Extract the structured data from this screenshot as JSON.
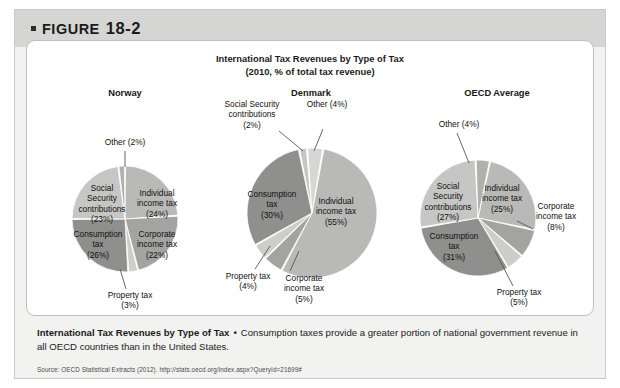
{
  "figure": {
    "label_prefix": "FIGURE",
    "number": "18-2"
  },
  "chart": {
    "title": "International Tax Revenues by Type of Tax",
    "subtitle": "(2010, % of total tax revenue)"
  },
  "caption": {
    "title": "International Tax Revenues by Type of Tax",
    "separator": "•",
    "body": "Consumption taxes provide a greater portion of national government revenue in all OECD countries than in the United States."
  },
  "source": {
    "text": "Source: OECD Statistical Extracts (2012). http://stats.oecd.org/index.aspx?QueryId=21699#"
  },
  "chart_data": [
    {
      "type": "pie",
      "title": "Norway",
      "categories": [
        "Individual income tax",
        "Corporate income tax",
        "Property tax",
        "Consumption tax",
        "Social Security contributions",
        "Other"
      ],
      "values": [
        24,
        22,
        3,
        26,
        23,
        2
      ],
      "labels": [
        "Individual\nincome tax\n(24%)",
        "Corporate\nincome tax\n(22%)",
        "Property tax\n(3%)",
        "Consumption\ntax\n(26%)",
        "Social\nSecurity\ncontributions\n(23%)",
        "Other (2%)"
      ],
      "colors": [
        "#b9b9b7",
        "#a3a3a1",
        "#cdcdcb",
        "#8f8f8d",
        "#c6c6c4",
        "#b0b0ae"
      ]
    },
    {
      "type": "pie",
      "title": "Denmark",
      "categories": [
        "Individual income tax",
        "Corporate income tax",
        "Property tax",
        "Consumption tax",
        "Social Security contributions",
        "Other"
      ],
      "values": [
        55,
        5,
        4,
        30,
        2,
        4
      ],
      "labels": [
        "Individual\nincome tax\n(55%)",
        "Corporate\nincome tax\n(5%)",
        "Property tax\n(4%)",
        "Consumption\ntax\n(30%)",
        "Social Security\ncontributions\n(2%)",
        "Other (4%)"
      ],
      "colors": [
        "#b9b9b7",
        "#a3a3a1",
        "#cdcdcb",
        "#8f8f8d",
        "#c6c6c4",
        "#d6d6d4"
      ]
    },
    {
      "type": "pie",
      "title": "OECD Average",
      "categories": [
        "Individual income tax",
        "Corporate income tax",
        "Property tax",
        "Consumption tax",
        "Social Security contributions",
        "Other"
      ],
      "values": [
        25,
        8,
        5,
        31,
        27,
        4
      ],
      "labels": [
        "Individual\nincome tax\n(25%)",
        "Corporate\nincome tax\n(8%)",
        "Property tax\n(5%)",
        "Consumption\ntax\n(31%)",
        "Social\nSecurity\ncontributions\n(27%)",
        "Other (4%)"
      ],
      "colors": [
        "#b9b9b7",
        "#a3a3a1",
        "#cdcdcb",
        "#8f8f8d",
        "#c6c6c4",
        "#b0b0ae"
      ]
    }
  ]
}
